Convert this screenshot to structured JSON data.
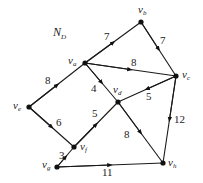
{
  "title": "N",
  "title_sub": "D",
  "nodes": {
    "a": {
      "label": "v",
      "sub": "a"
    },
    "b": {
      "label": "v",
      "sub": "b"
    },
    "c": {
      "label": "v",
      "sub": "c"
    },
    "d": {
      "label": "v",
      "sub": "d"
    },
    "e": {
      "label": "v",
      "sub": "e"
    },
    "f": {
      "label": "v",
      "sub": "f"
    },
    "g": {
      "label": "v",
      "sub": "g"
    },
    "h": {
      "label": "v",
      "sub": "h"
    }
  },
  "edges": [
    {
      "from": "v_a",
      "to": "v_b",
      "weight": "7"
    },
    {
      "from": "v_b",
      "to": "v_c",
      "weight": "7"
    },
    {
      "from": "v_a",
      "to": "v_c",
      "weight": "8"
    },
    {
      "from": "v_e",
      "to": "v_a",
      "weight": "8"
    },
    {
      "from": "v_d",
      "to": "v_a",
      "weight": "4"
    },
    {
      "from": "v_c",
      "to": "v_d",
      "weight": "5"
    },
    {
      "from": "v_e",
      "to": "v_f",
      "weight": "6"
    },
    {
      "from": "v_f",
      "to": "v_d",
      "weight": "5"
    },
    {
      "from": "v_d",
      "to": "v_h",
      "weight": "8"
    },
    {
      "from": "v_c",
      "to": "v_h",
      "weight": "12"
    },
    {
      "from": "v_g",
      "to": "v_f",
      "weight": "3"
    },
    {
      "from": "v_g",
      "to": "v_h",
      "weight": "11"
    }
  ]
}
